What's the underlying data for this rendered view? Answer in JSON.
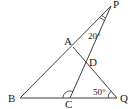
{
  "diagram": {
    "points": {
      "P": {
        "label": "P",
        "x": 111,
        "y": 6,
        "lx": 113,
        "ly": 8
      },
      "A": {
        "label": "A",
        "x": 73,
        "y": 47,
        "lx": 64,
        "ly": 45
      },
      "D": {
        "label": "D",
        "x": 86,
        "y": 62,
        "lx": 89,
        "ly": 66
      },
      "B": {
        "label": "B",
        "x": 20,
        "y": 98,
        "lx": 8,
        "ly": 102
      },
      "C": {
        "label": "C",
        "x": 70,
        "y": 98,
        "lx": 65,
        "ly": 108
      },
      "Q": {
        "label": "Q",
        "x": 117,
        "y": 98,
        "lx": 120,
        "ly": 102
      }
    },
    "segments": [
      {
        "name": "segment-BP",
        "from": "B",
        "to": "P"
      },
      {
        "name": "segment-PC",
        "from": "P",
        "to": "C"
      },
      {
        "name": "segment-AQ",
        "from": "A",
        "to": "Q"
      },
      {
        "name": "segment-BQ",
        "from": "B",
        "to": "Q"
      }
    ],
    "angles": [
      {
        "name": "angle-P",
        "vertex": "P",
        "label": "20°",
        "lx": 88,
        "ly": 39
      },
      {
        "name": "angle-Q",
        "vertex": "Q",
        "label": "50°",
        "lx": 93,
        "ly": 95
      },
      {
        "name": "angle-C",
        "vertex": "C",
        "label": ""
      }
    ]
  }
}
